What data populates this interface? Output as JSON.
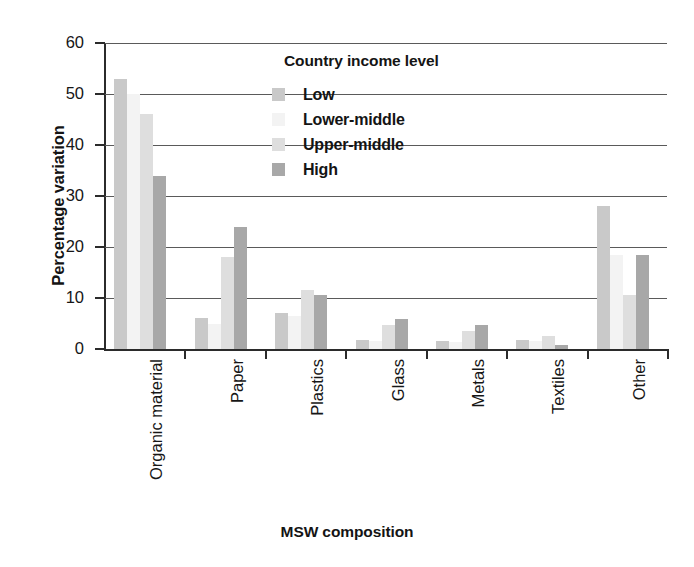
{
  "chart_data": {
    "type": "bar",
    "title": "",
    "xlabel": "MSW composition",
    "ylabel": "Percentage variation",
    "ylim": [
      0,
      60
    ],
    "yticks": [
      0,
      10,
      20,
      30,
      40,
      50,
      60
    ],
    "grid": true,
    "legend_position": "upper-center-inside",
    "legend_title": "Country income level",
    "categories": [
      "Organic material",
      "Paper",
      "Plastics",
      "Glass",
      "Metals",
      "Textiles",
      "Other"
    ],
    "series": [
      {
        "name": "Low",
        "color": "#c9c9c9",
        "values": [
          53,
          6,
          7,
          1.7,
          1.6,
          1.8,
          28
        ]
      },
      {
        "name": "Lower-middle",
        "color": "#f3f3f3",
        "values": [
          50,
          5,
          6.5,
          1.5,
          1.4,
          1.5,
          18.5
        ]
      },
      {
        "name": "Upper-middle",
        "color": "#dedede",
        "values": [
          46,
          18,
          11.5,
          4.8,
          3.5,
          2.5,
          10.5
        ]
      },
      {
        "name": "High",
        "color": "#a8a8a8",
        "values": [
          34,
          24,
          10.5,
          5.8,
          4.8,
          0.8,
          18.5
        ]
      }
    ]
  },
  "axes": {
    "y_title": "Percentage variation",
    "x_title": "MSW composition"
  },
  "legend": {
    "title": "Country income level",
    "entries": [
      {
        "label": "Low",
        "color": "#c9c9c9"
      },
      {
        "label": "Lower-middle",
        "color": "#f3f3f3"
      },
      {
        "label": "Upper-middle",
        "color": "#dedede"
      },
      {
        "label": "High",
        "color": "#a8a8a8"
      }
    ]
  }
}
